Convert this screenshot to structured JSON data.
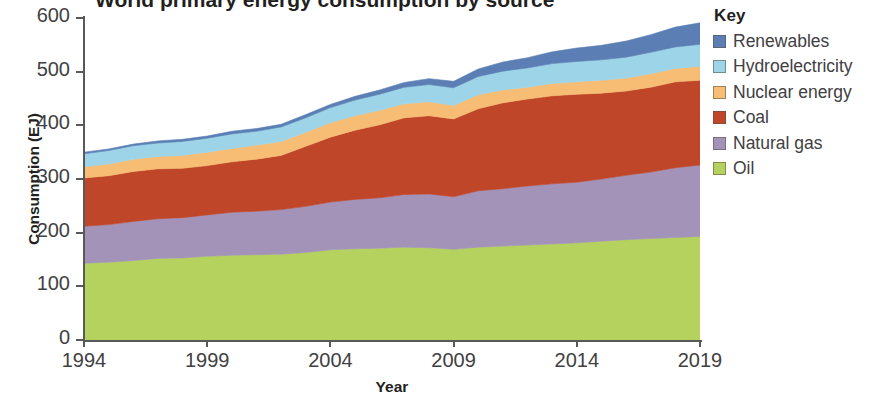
{
  "title": "World primary energy consumption by source",
  "axes": {
    "y_title": "Consumption (EJ)",
    "x_title": "Year",
    "y_ticks": [
      "0",
      "100",
      "200",
      "300",
      "400",
      "500",
      "600"
    ],
    "x_ticks": [
      "1994",
      "1999",
      "2004",
      "2009",
      "2014",
      "2019"
    ]
  },
  "legend": {
    "title": "Key",
    "items": [
      {
        "label": "Renewables",
        "color": "#5b7fb5"
      },
      {
        "label": "Hydroelectricity",
        "color": "#9ed4e8"
      },
      {
        "label": "Nuclear energy",
        "color": "#f7bd74"
      },
      {
        "label": "Coal",
        "color": "#c0462a"
      },
      {
        "label": "Natural gas",
        "color": "#a393b8"
      },
      {
        "label": "Oil",
        "color": "#b5d25f"
      }
    ]
  },
  "chart_data": {
    "type": "area",
    "stacked": true,
    "title": "World primary energy consumption by source",
    "xlabel": "Year",
    "ylabel": "Consumption (EJ)",
    "xlim": [
      1994,
      2019
    ],
    "ylim": [
      0,
      600
    ],
    "grid": false,
    "legend_position": "right",
    "units": "EJ",
    "x": [
      1994,
      1995,
      1996,
      1997,
      1998,
      1999,
      2000,
      2001,
      2002,
      2003,
      2004,
      2005,
      2006,
      2007,
      2008,
      2009,
      2010,
      2011,
      2012,
      2013,
      2014,
      2015,
      2016,
      2017,
      2018,
      2019
    ],
    "series": [
      {
        "name": "Oil",
        "color": "#b5d25f",
        "values": [
          143,
          145,
          148,
          152,
          153,
          156,
          158,
          159,
          160,
          163,
          168,
          170,
          171,
          173,
          172,
          169,
          173,
          175,
          177,
          179,
          181,
          184,
          187,
          189,
          191,
          193
        ]
      },
      {
        "name": "Natural gas",
        "color": "#a393b8",
        "values": [
          69,
          70,
          73,
          74,
          75,
          77,
          80,
          81,
          83,
          86,
          89,
          92,
          94,
          98,
          100,
          98,
          105,
          107,
          110,
          112,
          113,
          116,
          120,
          124,
          130,
          133
        ]
      },
      {
        "name": "Coal",
        "color": "#c0462a",
        "values": [
          90,
          91,
          93,
          93,
          92,
          92,
          94,
          97,
          101,
          112,
          121,
          129,
          136,
          143,
          146,
          145,
          153,
          160,
          162,
          164,
          164,
          160,
          157,
          158,
          160,
          158
        ]
      },
      {
        "name": "Nuclear energy",
        "color": "#f7bd74",
        "values": [
          21,
          22,
          23,
          23,
          24,
          25,
          25,
          26,
          26,
          26,
          27,
          27,
          27,
          26,
          26,
          25,
          26,
          24,
          22,
          23,
          23,
          24,
          24,
          25,
          25,
          26
        ]
      },
      {
        "name": "Hydroelectricity",
        "color": "#9ed4e8",
        "values": [
          24,
          25,
          25,
          25,
          26,
          26,
          27,
          26,
          27,
          27,
          28,
          29,
          30,
          31,
          32,
          33,
          34,
          35,
          36,
          37,
          38,
          38,
          39,
          40,
          40,
          41
        ]
      },
      {
        "name": "Renewables",
        "color": "#5b7fb5",
        "values": [
          3,
          3,
          3,
          4,
          4,
          4,
          5,
          5,
          5,
          6,
          6,
          7,
          8,
          9,
          11,
          12,
          14,
          17,
          19,
          22,
          25,
          27,
          30,
          33,
          37,
          40
        ]
      }
    ],
    "totals": [
      350,
      356,
      365,
      371,
      374,
      380,
      389,
      394,
      402,
      420,
      439,
      454,
      466,
      480,
      487,
      482,
      505,
      518,
      526,
      537,
      544,
      549,
      557,
      569,
      583,
      591
    ],
    "annotations": [
      {
        "x": 2009,
        "text": "dip in total consumption"
      }
    ]
  }
}
